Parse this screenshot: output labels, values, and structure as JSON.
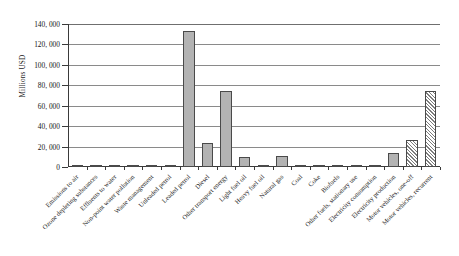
{
  "chart_data": {
    "type": "bar",
    "title": "",
    "xlabel": "",
    "ylabel": "Millions USD",
    "ylim": [
      0,
      140000
    ],
    "ytick_labels": [
      "140, 000",
      "120, 000",
      "100, 000",
      "80, 000",
      "60, 000",
      "40, 000",
      "20, 000",
      "0"
    ],
    "ytick_values": [
      140000,
      120000,
      100000,
      80000,
      60000,
      40000,
      20000,
      0
    ],
    "grid": true,
    "legend": "none",
    "categories": [
      "Emissions to air",
      "Ozone depleting substances",
      "Effluents to water",
      "Non-point water pollution",
      "Waste management",
      "Unleaded petrol",
      "Leaded petrol",
      "Diesel",
      "Other transport energy",
      "Light fuel oil",
      "Heavy fuel oil",
      "Natural gas",
      "Coal",
      "Coke",
      "Biofuels",
      "Other fuels, stationary use",
      "Electricity consumption",
      "Electricity production",
      "Motor vehicles, one-off",
      "Motor vehicles, recurrent"
    ],
    "values": [
      300,
      200,
      250,
      300,
      2200,
      2400,
      133000,
      24000,
      74000,
      10000,
      1000,
      11000,
      800,
      300,
      300,
      1200,
      1500,
      14000,
      26000,
      74000
    ],
    "bar_styles": [
      "solid",
      "solid",
      "solid",
      "solid",
      "solid",
      "solid",
      "solid",
      "solid",
      "solid",
      "solid",
      "solid",
      "solid",
      "solid",
      "solid",
      "solid",
      "solid",
      "solid",
      "solid",
      "hatched",
      "hatched"
    ],
    "colors": {
      "bar_fill": "#b3b3b3",
      "bar_edge": "#4a4a4a",
      "gridline": "#8a8a8a",
      "axis": "#3a3a3a",
      "text": "#1a1a1a",
      "background": "#ffffff"
    }
  }
}
